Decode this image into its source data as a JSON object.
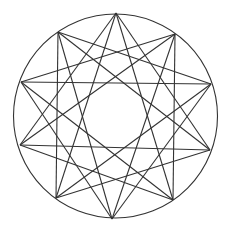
{
  "diagram": {
    "type": "star-polygon-in-circle",
    "stroke_color": "#333333",
    "background": "#ffffff",
    "circle": {
      "cx": 115.5,
      "cy": 116,
      "r": 102
    },
    "vertices": [
      [
        116,
        13
      ],
      [
        175,
        34
      ],
      [
        211,
        84
      ],
      [
        210,
        150
      ],
      [
        173,
        200
      ],
      [
        112,
        219
      ],
      [
        56,
        198
      ],
      [
        20,
        145
      ],
      [
        21,
        82
      ],
      [
        58,
        32
      ]
    ],
    "chord_steps": [
      3,
      4
    ]
  }
}
